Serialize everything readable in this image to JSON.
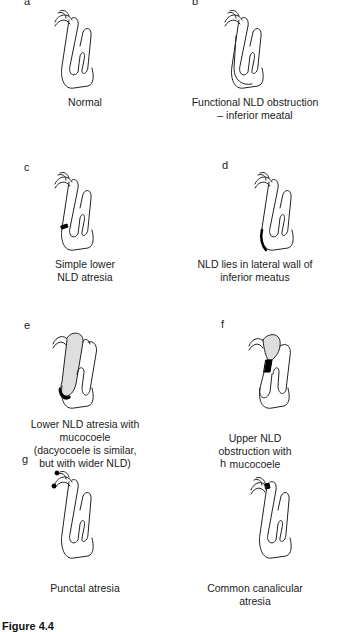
{
  "panels": [
    {
      "letter": "a",
      "caption": "Normal",
      "variant": "normal"
    },
    {
      "letter": "b",
      "caption": "Functional NLD obstruction\n– inferior meatal",
      "variant": "functional"
    },
    {
      "letter": "c",
      "caption": "Simple lower\nNLD atresia",
      "variant": "simple-lower"
    },
    {
      "letter": "d",
      "caption": "NLD lies in lateral wall of\ninferior meatus",
      "variant": "lateral-wall"
    },
    {
      "letter": "e",
      "caption": "Lower NLD atresia with\nmucocoele\n(dacyocoele is similar,\nbut with wider NLD)",
      "variant": "lower-mucocoele"
    },
    {
      "letter": "f",
      "caption": "Upper NLD\nobstruction with\nmucocoele",
      "variant": "upper-mucocoele"
    },
    {
      "letter": "g",
      "caption": "Punctal atresia",
      "variant": "punctal"
    },
    {
      "letter": "h",
      "caption": "Common canalicular\natresia",
      "variant": "canalicular"
    }
  ],
  "figure_label": "Figure 4.4"
}
